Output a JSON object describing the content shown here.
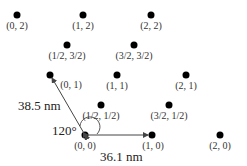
{
  "diagram": {
    "points": [
      {
        "label": "(0, 2)",
        "x": 17,
        "y": 15
      },
      {
        "label": "(1, 2)",
        "x": 83,
        "y": 15
      },
      {
        "label": "(2, 2)",
        "x": 151,
        "y": 15
      },
      {
        "label": "(1/2, 3/2)",
        "x": 67,
        "y": 45
      },
      {
        "label": "(3/2, 3/2)",
        "x": 134,
        "y": 45
      },
      {
        "label": "(0, 1)",
        "x": 50,
        "y": 75
      },
      {
        "label": "(1, 1)",
        "x": 117,
        "y": 75
      },
      {
        "label": "(2, 1)",
        "x": 186,
        "y": 75
      },
      {
        "label": "(1/2, 1/2)",
        "x": 101,
        "y": 105
      },
      {
        "label": "(3/2, 1/2)",
        "x": 169,
        "y": 105
      },
      {
        "label": "(0, 0)",
        "x": 85,
        "y": 135
      },
      {
        "label": "(1, 0)",
        "x": 152,
        "y": 135
      },
      {
        "label": "(2, 0)",
        "x": 220,
        "y": 135
      }
    ],
    "measurements": {
      "vertical_vector": "38.5 nm",
      "horizontal_vector": "36.1 nm",
      "angle": "120°"
    }
  }
}
